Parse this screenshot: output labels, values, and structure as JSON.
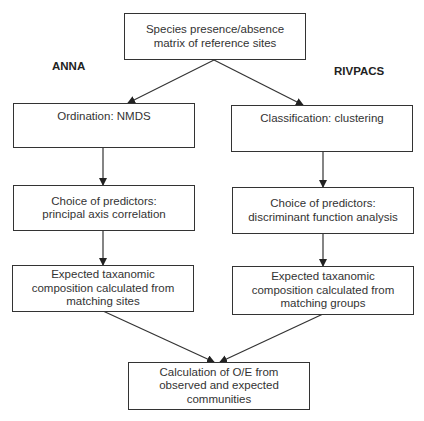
{
  "diagram": {
    "type": "flowchart",
    "root": {
      "text": "Species presence/absence\nmatrix of reference sites"
    },
    "branches": [
      {
        "label": "ANNA",
        "steps": [
          {
            "text": "Ordination: NMDS"
          },
          {
            "text": "Choice of predictors:\nprincipal axis correlation"
          },
          {
            "text": "Expected taxanomic\ncomposition calculated from\nmatching sites"
          }
        ]
      },
      {
        "label": "RIVPACS",
        "steps": [
          {
            "text": "Classification: clustering"
          },
          {
            "text": "Choice of predictors:\ndiscriminant function analysis"
          },
          {
            "text": "Expected taxanomic\ncomposition calculated from\nmatching groups"
          }
        ]
      }
    ],
    "final": {
      "text": "Calculation of O/E from\nobserved and expected\ncommunities"
    }
  }
}
